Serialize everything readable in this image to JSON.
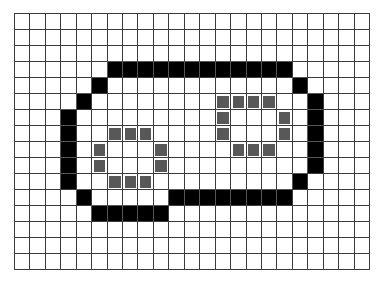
{
  "board": {
    "cols": 23,
    "rows": 16,
    "colors": {
      "empty": "#ffffff",
      "black": "#000000",
      "gray": "#585858",
      "grid": "#3a3a3a"
    },
    "black_cells": [
      [
        3,
        6
      ],
      [
        3,
        7
      ],
      [
        3,
        8
      ],
      [
        3,
        9
      ],
      [
        3,
        10
      ],
      [
        3,
        11
      ],
      [
        3,
        12
      ],
      [
        3,
        13
      ],
      [
        3,
        14
      ],
      [
        3,
        15
      ],
      [
        3,
        16
      ],
      [
        3,
        17
      ],
      [
        4,
        5
      ],
      [
        4,
        18
      ],
      [
        5,
        4
      ],
      [
        5,
        19
      ],
      [
        6,
        3
      ],
      [
        6,
        19
      ],
      [
        7,
        3
      ],
      [
        7,
        19
      ],
      [
        8,
        3
      ],
      [
        8,
        19
      ],
      [
        9,
        3
      ],
      [
        9,
        19
      ],
      [
        10,
        3
      ],
      [
        10,
        18
      ],
      [
        11,
        4
      ],
      [
        11,
        10
      ],
      [
        11,
        11
      ],
      [
        11,
        12
      ],
      [
        11,
        13
      ],
      [
        11,
        14
      ],
      [
        11,
        15
      ],
      [
        11,
        16
      ],
      [
        11,
        17
      ],
      [
        12,
        5
      ],
      [
        12,
        6
      ],
      [
        12,
        7
      ],
      [
        12,
        8
      ],
      [
        12,
        9
      ]
    ],
    "gray_cells": [
      [
        5,
        13
      ],
      [
        5,
        14
      ],
      [
        5,
        15
      ],
      [
        5,
        16
      ],
      [
        6,
        13
      ],
      [
        6,
        17
      ],
      [
        7,
        6
      ],
      [
        7,
        7
      ],
      [
        7,
        8
      ],
      [
        7,
        13
      ],
      [
        7,
        17
      ],
      [
        8,
        5
      ],
      [
        8,
        9
      ],
      [
        8,
        14
      ],
      [
        8,
        15
      ],
      [
        8,
        16
      ],
      [
        9,
        5
      ],
      [
        9,
        9
      ],
      [
        10,
        6
      ],
      [
        10,
        7
      ],
      [
        10,
        8
      ]
    ]
  }
}
